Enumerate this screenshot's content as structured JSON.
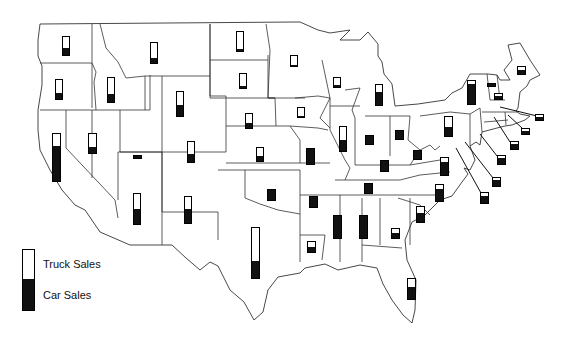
{
  "chart_data": {
    "type": "map-bar",
    "title": "",
    "legend": [
      {
        "label": "Truck Sales",
        "color": "#ffffff"
      },
      {
        "label": "Car Sales",
        "color": "#111111"
      }
    ],
    "note": "Each state shows a vertical bar; bar height = total sales (relative), black portion = car sales share, white = truck sales share. Values are relative estimates read from pixel heights.",
    "states": [
      {
        "state": "WA",
        "x": 62,
        "y": 36,
        "w": 8,
        "h": 20,
        "car_frac": 0.4
      },
      {
        "state": "OR",
        "x": 55,
        "y": 79,
        "w": 8,
        "h": 21,
        "car_frac": 0.33
      },
      {
        "state": "ID",
        "x": 107,
        "y": 77,
        "w": 8,
        "h": 26,
        "car_frac": 0.35
      },
      {
        "state": "MT",
        "x": 150,
        "y": 42,
        "w": 8,
        "h": 22,
        "car_frac": 0.25
      },
      {
        "state": "WY",
        "x": 176,
        "y": 91,
        "w": 8,
        "h": 26,
        "car_frac": 0.45
      },
      {
        "state": "CA",
        "x": 52,
        "y": 133,
        "w": 9,
        "h": 49,
        "car_frac": 0.75
      },
      {
        "state": "NV",
        "x": 88,
        "y": 133,
        "w": 9,
        "h": 21,
        "car_frac": 0.3
      },
      {
        "state": "UT",
        "x": 133,
        "y": 155,
        "w": 9,
        "h": 4,
        "car_frac": 1.0
      },
      {
        "state": "CO",
        "x": 187,
        "y": 141,
        "w": 8,
        "h": 22,
        "car_frac": 0.4
      },
      {
        "state": "AZ",
        "x": 133,
        "y": 193,
        "w": 8,
        "h": 32,
        "car_frac": 0.5
      },
      {
        "state": "NM",
        "x": 184,
        "y": 196,
        "w": 8,
        "h": 28,
        "car_frac": 0.55
      },
      {
        "state": "ND",
        "x": 236,
        "y": 31,
        "w": 8,
        "h": 21,
        "car_frac": 0.12
      },
      {
        "state": "SD",
        "x": 239,
        "y": 73,
        "w": 8,
        "h": 16,
        "car_frac": 0.12
      },
      {
        "state": "NE",
        "x": 245,
        "y": 113,
        "w": 8,
        "h": 16,
        "car_frac": 0.35
      },
      {
        "state": "KS",
        "x": 256,
        "y": 147,
        "w": 8,
        "h": 15,
        "car_frac": 0.4
      },
      {
        "state": "OK",
        "x": 267,
        "y": 189,
        "w": 9,
        "h": 12,
        "car_frac": 1.0
      },
      {
        "state": "TX",
        "x": 251,
        "y": 227,
        "w": 9,
        "h": 52,
        "car_frac": 0.35
      },
      {
        "state": "MN",
        "x": 290,
        "y": 55,
        "w": 8,
        "h": 12,
        "car_frac": 0.15
      },
      {
        "state": "IA",
        "x": 297,
        "y": 107,
        "w": 8,
        "h": 11,
        "car_frac": 0.15
      },
      {
        "state": "MO",
        "x": 306,
        "y": 148,
        "w": 9,
        "h": 17,
        "car_frac": 1.0
      },
      {
        "state": "AR",
        "x": 309,
        "y": 196,
        "w": 9,
        "h": 12,
        "car_frac": 1.0
      },
      {
        "state": "LA",
        "x": 307,
        "y": 241,
        "w": 9,
        "h": 12,
        "car_frac": 0.55
      },
      {
        "state": "WI",
        "x": 333,
        "y": 77,
        "w": 8,
        "h": 11,
        "car_frac": 0.25
      },
      {
        "state": "IL",
        "x": 339,
        "y": 126,
        "w": 8,
        "h": 26,
        "car_frac": 0.45
      },
      {
        "state": "MI",
        "x": 375,
        "y": 84,
        "w": 8,
        "h": 22,
        "car_frac": 0.65
      },
      {
        "state": "IN",
        "x": 365,
        "y": 135,
        "w": 9,
        "h": 10,
        "car_frac": 1.0
      },
      {
        "state": "OH",
        "x": 395,
        "y": 130,
        "w": 9,
        "h": 10,
        "car_frac": 1.0
      },
      {
        "state": "KY",
        "x": 380,
        "y": 160,
        "w": 9,
        "h": 12,
        "car_frac": 1.0
      },
      {
        "state": "TN",
        "x": 364,
        "y": 183,
        "w": 9,
        "h": 11,
        "car_frac": 1.0
      },
      {
        "state": "MS",
        "x": 333,
        "y": 215,
        "w": 9,
        "h": 24,
        "car_frac": 1.0
      },
      {
        "state": "AL",
        "x": 359,
        "y": 215,
        "w": 9,
        "h": 24,
        "car_frac": 1.0
      },
      {
        "state": "GA",
        "x": 391,
        "y": 228,
        "w": 9,
        "h": 11,
        "car_frac": 0.6
      },
      {
        "state": "FL",
        "x": 407,
        "y": 278,
        "w": 9,
        "h": 22,
        "car_frac": 0.6
      },
      {
        "state": "SC",
        "x": 416,
        "y": 206,
        "w": 9,
        "h": 17,
        "car_frac": 0.6
      },
      {
        "state": "NC",
        "x": 435,
        "y": 184,
        "w": 9,
        "h": 18,
        "car_frac": 0.75
      },
      {
        "state": "VA",
        "x": 440,
        "y": 157,
        "w": 9,
        "h": 19,
        "car_frac": 0.75
      },
      {
        "state": "WV",
        "x": 413,
        "y": 150,
        "w": 9,
        "h": 10,
        "car_frac": 1.0
      },
      {
        "state": "PA",
        "x": 444,
        "y": 116,
        "w": 9,
        "h": 21,
        "car_frac": 0.45
      },
      {
        "state": "NY",
        "x": 467,
        "y": 80,
        "w": 9,
        "h": 25,
        "car_frac": 0.85
      },
      {
        "state": "VT",
        "x": 487,
        "y": 83,
        "w": 9,
        "h": 4,
        "car_frac": 1.0
      },
      {
        "state": "NH",
        "x": 494,
        "y": 93,
        "w": 9,
        "h": 7,
        "car_frac": 0.55
      },
      {
        "state": "ME",
        "x": 517,
        "y": 66,
        "w": 9,
        "h": 9,
        "car_frac": 0.55
      },
      {
        "state": "MA",
        "x": 535,
        "y": 114,
        "w": 9,
        "h": 7,
        "car_frac": 0.55
      },
      {
        "state": "RI",
        "x": 521,
        "y": 128,
        "w": 9,
        "h": 7,
        "car_frac": 0.55
      },
      {
        "state": "CT",
        "x": 510,
        "y": 141,
        "w": 9,
        "h": 9,
        "car_frac": 0.65
      },
      {
        "state": "NJ",
        "x": 497,
        "y": 155,
        "w": 9,
        "h": 10,
        "car_frac": 0.8
      },
      {
        "state": "DE",
        "x": 492,
        "y": 177,
        "w": 9,
        "h": 10,
        "car_frac": 0.7
      },
      {
        "state": "MD",
        "x": 480,
        "y": 192,
        "w": 9,
        "h": 12,
        "car_frac": 0.75
      }
    ]
  }
}
